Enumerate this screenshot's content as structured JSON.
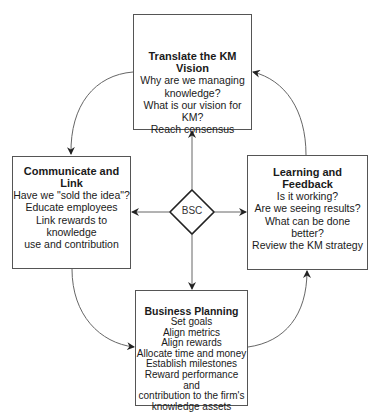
{
  "diagram": {
    "center": {
      "label": "BSC"
    },
    "boxes": {
      "vision": {
        "title": "Translate the KM Vision",
        "lines": [
          "Why are we managing",
          "knowledge?",
          "What is our vision for KM?",
          "Reach consensus"
        ]
      },
      "communicate": {
        "title": "Communicate and Link",
        "lines": [
          "Have we \"sold the idea\"?",
          "Educate employees",
          "Link rewards to knowledge",
          "use and contribution"
        ]
      },
      "learning": {
        "title": "Learning and Feedback",
        "lines": [
          "Is it working?",
          "Are we seeing results?",
          "What can be done better?",
          "Review the KM strategy"
        ]
      },
      "planning": {
        "title": "Business Planning",
        "lines": [
          "Set goals",
          "Align metrics",
          "Align rewards",
          "Allocate time and money",
          "Establish milestones",
          "Reward performance and",
          "contribution to the firm's",
          "knowledge assets"
        ]
      }
    },
    "colors": {
      "stroke": "#555555",
      "text": "#1a1a1a",
      "background": "#ffffff"
    }
  }
}
